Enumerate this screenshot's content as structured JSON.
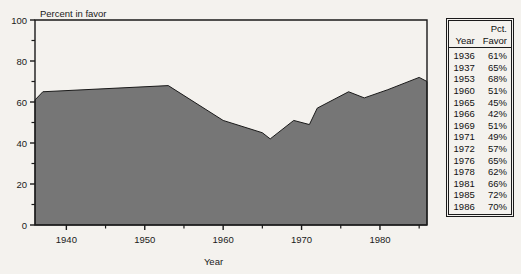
{
  "chart_data": {
    "type": "area",
    "title": "",
    "ylabel": "Percent in favor",
    "xlabel": "Year",
    "x": [
      1936,
      1937,
      1953,
      1960,
      1965,
      1966,
      1969,
      1971,
      1972,
      1976,
      1978,
      1981,
      1985,
      1986
    ],
    "values": [
      61,
      65,
      68,
      51,
      45,
      42,
      51,
      49,
      57,
      65,
      62,
      66,
      72,
      70
    ],
    "series": [
      {
        "name": "Percent in favor",
        "values": [
          61,
          65,
          68,
          51,
          45,
          42,
          51,
          49,
          57,
          65,
          62,
          66,
          72,
          70
        ]
      }
    ],
    "xlim": [
      1936,
      1986
    ],
    "ylim": [
      0,
      100
    ],
    "ytick_labels": [
      "0",
      "20",
      "40",
      "60",
      "80",
      "100"
    ],
    "ytick_values": [
      0,
      20,
      40,
      60,
      80,
      100
    ],
    "yminor_values": [
      10,
      30,
      50,
      70,
      90
    ],
    "xtick_labels": [
      "1940",
      "1950",
      "1960",
      "1970",
      "1980"
    ],
    "xtick_values": [
      1940,
      1950,
      1960,
      1970,
      1980
    ],
    "xminor_values": [
      1945,
      1955,
      1965,
      1975,
      1985
    ],
    "grid": false,
    "legend": "none",
    "fill_color": "#767676",
    "line_color": "#1a1a1a",
    "background_color": "#f4f2ee"
  },
  "axes": {
    "y_top_label": "Percent in favor",
    "x_title": "Year"
  },
  "table": {
    "header_line1_year": "",
    "header_line1_pct": "Pct.",
    "header_line2_year": "Year",
    "header_line2_pct": "Favor",
    "rows": [
      {
        "year": "1936",
        "pct": "61%"
      },
      {
        "year": "1937",
        "pct": "65%"
      },
      {
        "year": "1953",
        "pct": "68%"
      },
      {
        "year": "1960",
        "pct": "51%"
      },
      {
        "year": "1965",
        "pct": "45%"
      },
      {
        "year": "1966",
        "pct": "42%"
      },
      {
        "year": "1969",
        "pct": "51%"
      },
      {
        "year": "1971",
        "pct": "49%"
      },
      {
        "year": "1972",
        "pct": "57%"
      },
      {
        "year": "1976",
        "pct": "65%"
      },
      {
        "year": "1978",
        "pct": "62%"
      },
      {
        "year": "1981",
        "pct": "66%"
      },
      {
        "year": "1985",
        "pct": "72%"
      },
      {
        "year": "1986",
        "pct": "70%"
      }
    ]
  }
}
